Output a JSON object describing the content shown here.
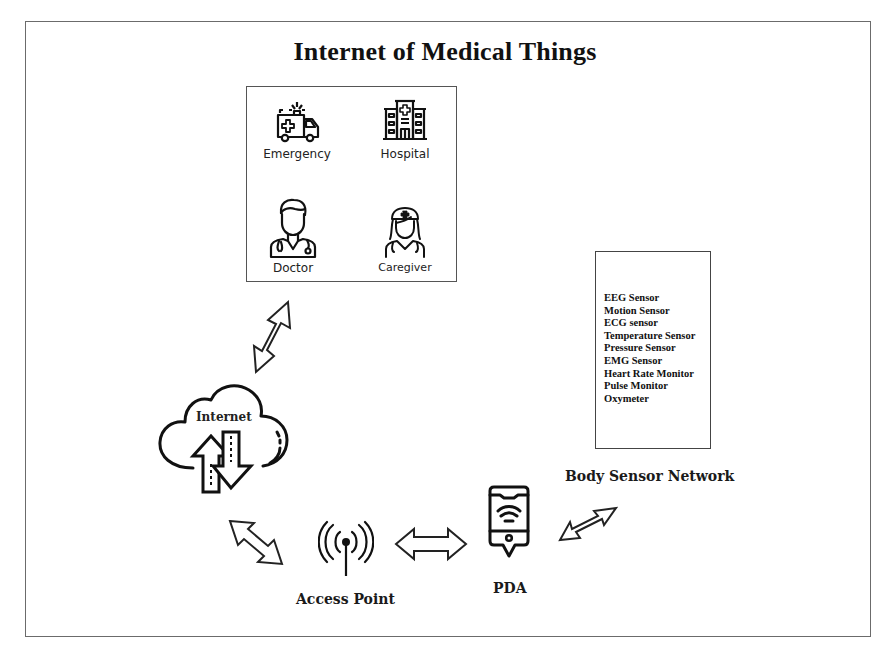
{
  "title": "Internet of Medical Things",
  "care_providers": {
    "items": [
      {
        "label": "Emergency",
        "icon": "ambulance-icon"
      },
      {
        "label": "Hospital",
        "icon": "hospital-icon"
      },
      {
        "label": "Doctor",
        "icon": "doctor-icon"
      },
      {
        "label": "Caregiver",
        "icon": "nurse-icon"
      }
    ]
  },
  "internet": {
    "label": "Internet",
    "icon": "cloud-upload-download-icon"
  },
  "access_point": {
    "label": "Access Point",
    "icon": "antenna-signal-icon"
  },
  "pda": {
    "label": "PDA",
    "icon": "smartphone-wifi-icon"
  },
  "body_sensor_network": {
    "label": "Body Sensor Network",
    "sensors": [
      "EEG Sensor",
      "Motion Sensor",
      "ECG sensor",
      "Temperature Sensor",
      "Pressure Sensor",
      "EMG Sensor",
      "Heart Rate Monitor",
      "Pulse Monitor",
      "Oxymeter"
    ]
  },
  "connections": [
    {
      "from": "care_providers",
      "to": "internet",
      "type": "bidirectional"
    },
    {
      "from": "internet",
      "to": "access_point",
      "type": "bidirectional"
    },
    {
      "from": "access_point",
      "to": "pda",
      "type": "bidirectional"
    },
    {
      "from": "pda",
      "to": "body_sensor_network",
      "type": "bidirectional"
    }
  ]
}
